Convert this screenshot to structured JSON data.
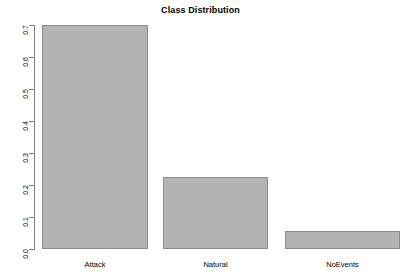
{
  "chart_data": {
    "type": "bar",
    "title": "Class Distribution",
    "xlabel": "",
    "ylabel": "",
    "categories": [
      "Attack",
      "Natural",
      "NoEvents"
    ],
    "values": [
      0.7,
      0.225,
      0.056
    ],
    "ylim": [
      0.0,
      0.7
    ],
    "yticks": [
      "0.0",
      "0.1",
      "0.2",
      "0.3",
      "0.4",
      "0.5",
      "0.6",
      "0.7"
    ],
    "ytick_values": [
      0.0,
      0.1,
      0.2,
      0.3,
      0.4,
      0.5,
      0.6,
      0.7
    ],
    "grid": false,
    "legend": false,
    "bar_color": "#b3b3b3",
    "bar_border_color": "#8c8c8c",
    "axis_color": "#808080"
  },
  "axis": {
    "tick_0": "0.0",
    "tick_1": "0.1",
    "tick_2": "0.2",
    "tick_3": "0.3",
    "tick_4": "0.4",
    "tick_5": "0.5",
    "tick_6": "0.6",
    "tick_7": "0.7"
  },
  "categories": {
    "cat_0": "Attack",
    "cat_1": "Natural",
    "cat_2": "NoEvents"
  }
}
